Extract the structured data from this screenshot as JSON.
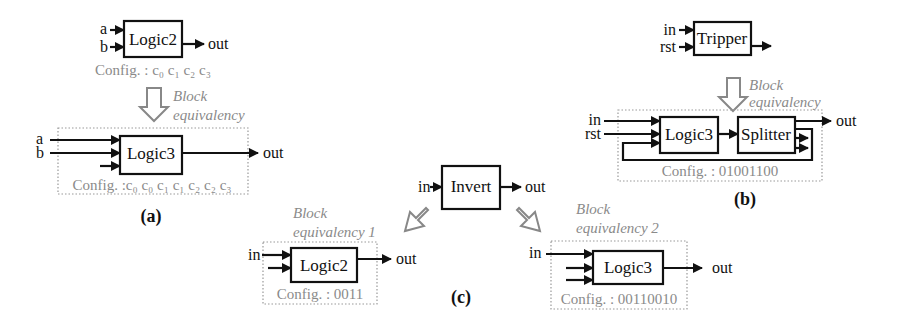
{
  "figure": {
    "panels": {
      "a": {
        "caption": "(a)",
        "original": {
          "block": "Logic2",
          "inputs": [
            "a",
            "b"
          ],
          "output": "out",
          "config": "Config. : c₀ c₁ c₂ c₃"
        },
        "transform_label_line1": "Block",
        "transform_label_line2": "equivalency",
        "equivalent": {
          "block": "Logic3",
          "inputs": [
            "a",
            "b",
            ""
          ],
          "output": "out",
          "config": "Config. :c₀ c₀ c₁ c₁ c₂ c₂ c₃"
        }
      },
      "b": {
        "caption": "(b)",
        "original": {
          "block": "Tripper",
          "inputs": [
            "in",
            "rst"
          ],
          "output": ""
        },
        "transform_label_line1": "Block",
        "transform_label_line2": "equivalency",
        "equivalent": {
          "blocks": [
            "Logic3",
            "Splitter"
          ],
          "inputs": [
            "in",
            "rst"
          ],
          "output": "out",
          "config": "Config. : 01001100"
        }
      },
      "c": {
        "caption": "(c)",
        "original": {
          "block": "Invert",
          "input": "in",
          "output": "out"
        },
        "equiv1": {
          "label_line1": "Block",
          "label_line2": "equivalency 1",
          "block": "Logic2",
          "input": "in",
          "output": "out",
          "config": "Config. : 0011"
        },
        "equiv2": {
          "label_line1": "Block",
          "label_line2": "equivalency 2",
          "block": "Logic3",
          "input": "in",
          "output": "out",
          "config": "Config. : 00110010"
        }
      }
    },
    "colors": {
      "line": "#111111",
      "config_text": "#8a8a8a",
      "dotted_border": "#999999",
      "hollow_arrow": "#888888"
    }
  }
}
